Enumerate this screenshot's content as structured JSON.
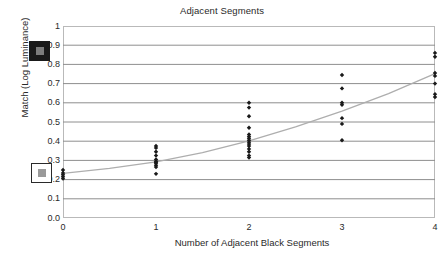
{
  "chart_data": {
    "type": "scatter",
    "title": "Adjacent Segments",
    "xlabel": "Number of Adjacent Black Segments",
    "ylabel": "Match (Log Luminance)",
    "xlim": [
      0,
      4
    ],
    "ylim": [
      0,
      1
    ],
    "grid": true,
    "legend": "none",
    "xticks": [
      "0",
      "1",
      "2",
      "3",
      "4"
    ],
    "yticks": [
      "1",
      "0.9",
      "0.8",
      "0.7",
      "0.6",
      "0.5",
      "0.4",
      "0.3",
      "0.2",
      "0.1",
      "0.0"
    ],
    "xtick_values": [
      0,
      1,
      2,
      3,
      4
    ],
    "ytick_values": [
      1,
      0.9,
      0.8,
      0.7,
      0.6,
      0.5,
      0.4,
      0.3,
      0.2,
      0.1,
      0.0
    ],
    "series": [
      {
        "name": "Match data",
        "marker": "diamond",
        "color": "#1a1a1a",
        "points": [
          {
            "x": 0,
            "y": 0.25
          },
          {
            "x": 0,
            "y": 0.235
          },
          {
            "x": 0,
            "y": 0.225
          },
          {
            "x": 0,
            "y": 0.215
          },
          {
            "x": 0,
            "y": 0.205
          },
          {
            "x": 1,
            "y": 0.375
          },
          {
            "x": 1,
            "y": 0.365
          },
          {
            "x": 1,
            "y": 0.345
          },
          {
            "x": 1,
            "y": 0.325
          },
          {
            "x": 1,
            "y": 0.305
          },
          {
            "x": 1,
            "y": 0.295
          },
          {
            "x": 1,
            "y": 0.29
          },
          {
            "x": 1,
            "y": 0.285
          },
          {
            "x": 1,
            "y": 0.275
          },
          {
            "x": 1,
            "y": 0.265
          },
          {
            "x": 1,
            "y": 0.23
          },
          {
            "x": 2,
            "y": 0.6
          },
          {
            "x": 2,
            "y": 0.575
          },
          {
            "x": 2,
            "y": 0.53
          },
          {
            "x": 2,
            "y": 0.47
          },
          {
            "x": 2,
            "y": 0.435
          },
          {
            "x": 2,
            "y": 0.425
          },
          {
            "x": 2,
            "y": 0.415
          },
          {
            "x": 2,
            "y": 0.405
          },
          {
            "x": 2,
            "y": 0.395
          },
          {
            "x": 2,
            "y": 0.385
          },
          {
            "x": 2,
            "y": 0.375
          },
          {
            "x": 2,
            "y": 0.36
          },
          {
            "x": 2,
            "y": 0.345
          },
          {
            "x": 2,
            "y": 0.325
          },
          {
            "x": 2,
            "y": 0.315
          },
          {
            "x": 3,
            "y": 0.745
          },
          {
            "x": 3,
            "y": 0.675
          },
          {
            "x": 3,
            "y": 0.6
          },
          {
            "x": 3,
            "y": 0.59
          },
          {
            "x": 3,
            "y": 0.52
          },
          {
            "x": 3,
            "y": 0.49
          },
          {
            "x": 3,
            "y": 0.405
          },
          {
            "x": 4,
            "y": 0.86
          },
          {
            "x": 4,
            "y": 0.84
          },
          {
            "x": 4,
            "y": 0.755
          },
          {
            "x": 4,
            "y": 0.74
          },
          {
            "x": 4,
            "y": 0.7
          },
          {
            "x": 4,
            "y": 0.645
          },
          {
            "x": 4,
            "y": 0.63
          }
        ]
      }
    ],
    "trendline": {
      "name": "fit curve",
      "color": "#aeaeae",
      "points": [
        {
          "x": 0,
          "y": 0.232
        },
        {
          "x": 0.5,
          "y": 0.258
        },
        {
          "x": 1,
          "y": 0.292
        },
        {
          "x": 1.5,
          "y": 0.34
        },
        {
          "x": 2,
          "y": 0.402
        },
        {
          "x": 2.5,
          "y": 0.475
        },
        {
          "x": 3,
          "y": 0.557
        },
        {
          "x": 3.5,
          "y": 0.648
        },
        {
          "x": 4,
          "y": 0.752
        }
      ]
    },
    "swatches": [
      {
        "name": "dark-surround-swatch",
        "outer_color": "#1a1a1a",
        "inner_color": "#7d7d7d",
        "y_value": 0.85
      },
      {
        "name": "light-surround-swatch",
        "outer_color": "#ffffff",
        "inner_color": "#9a9a9a",
        "y_value": 0.24
      }
    ]
  },
  "colors": {
    "gridline": "#8e8e8e",
    "axis": "#2a2a2a",
    "plot_border": "#b9b9b9",
    "marker": "#1a1a1a",
    "trend": "#aeaeae",
    "background": "#ffffff"
  }
}
